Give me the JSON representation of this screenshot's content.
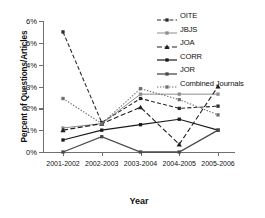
{
  "chart_data": {
    "type": "line",
    "title": "",
    "xlabel": "Year",
    "ylabel": "Percent of Questions/Articles",
    "categories": [
      "2001-2002",
      "2002-2003",
      "2003-2004",
      "2004-2005",
      "2005-2006"
    ],
    "ytick_labels": [
      "0%",
      "1%",
      "2%",
      "3%",
      "4%",
      "5%",
      "6%"
    ],
    "ytick_values": [
      0,
      1,
      2,
      3,
      4,
      5,
      6
    ],
    "ylim": [
      0,
      6
    ],
    "grid": false,
    "legend_position": "top-right",
    "series": [
      {
        "name": "OITE",
        "values": [
          5.5,
          1.35,
          2.45,
          2.0,
          2.1
        ],
        "color": "#2b2b2b",
        "dash": "4,2.2",
        "marker": "square",
        "width": 1.1
      },
      {
        "name": "JBJS",
        "values": [
          1.1,
          1.3,
          2.65,
          2.65,
          2.65
        ],
        "color": "#8c8c8c",
        "dash": "none",
        "marker": "square",
        "width": 1.0
      },
      {
        "name": "JOA",
        "values": [
          1.0,
          1.3,
          2.05,
          0.35,
          3.0
        ],
        "color": "#1f1f1f",
        "dash": "5,2.5",
        "marker": "triangle",
        "width": 1.1
      },
      {
        "name": "CORR",
        "values": [
          0.55,
          1.0,
          1.25,
          1.5,
          1.0
        ],
        "color": "#1a1a1a",
        "dash": "none",
        "marker": "square",
        "width": 1.2
      },
      {
        "name": "JOR",
        "values": [
          0.0,
          0.7,
          0.0,
          0.0,
          1.0
        ],
        "color": "#4a4a4a",
        "dash": "none",
        "marker": "square",
        "width": 1.3
      },
      {
        "name": "Combined Journals",
        "values": [
          2.45,
          1.3,
          2.9,
          2.4,
          1.7
        ],
        "color": "#6e6e6e",
        "dash": "1.4,1.6",
        "marker": "square",
        "width": 1.1
      }
    ]
  },
  "caption": {
    "text": ""
  }
}
